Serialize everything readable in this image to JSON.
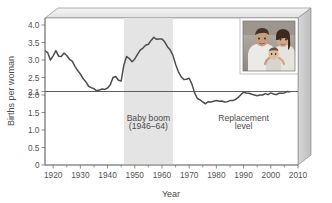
{
  "chart_data": {
    "type": "line",
    "title": "",
    "xlabel": "Year",
    "ylabel": "Births per woman",
    "xlim": [
      1917,
      2010
    ],
    "ylim": [
      0,
      4.2
    ],
    "grid": false,
    "legend_position": "none",
    "x_ticks": [
      1920,
      1930,
      1940,
      1950,
      1960,
      1970,
      1980,
      1990,
      2000,
      2010
    ],
    "x_tick_labels": [
      "1920",
      "1930",
      "1940",
      "1950",
      "1960",
      "1970",
      "1980",
      "1990",
      "2000",
      "2010"
    ],
    "x_minor_ticks": [
      1925,
      1935,
      1945,
      1955,
      1965,
      1975,
      1985,
      1995,
      2005
    ],
    "y_ticks": [
      0,
      0.5,
      1.0,
      1.5,
      2.0,
      2.1,
      2.5,
      3.0,
      3.5,
      4.0
    ],
    "y_tick_labels": [
      "0",
      "0.5",
      "1.0",
      "1.5",
      "2.0",
      "2.1",
      "2.5",
      "3.0",
      "3.5",
      "4.0"
    ],
    "series": [
      {
        "name": "Total fertility rate",
        "color": "#4d4d4d",
        "x": [
          1917,
          1918,
          1919,
          1920,
          1921,
          1922,
          1923,
          1924,
          1925,
          1926,
          1927,
          1928,
          1929,
          1930,
          1931,
          1932,
          1933,
          1934,
          1935,
          1936,
          1937,
          1938,
          1939,
          1940,
          1941,
          1942,
          1943,
          1944,
          1945,
          1946,
          1947,
          1948,
          1949,
          1950,
          1951,
          1952,
          1953,
          1954,
          1955,
          1956,
          1957,
          1958,
          1959,
          1960,
          1961,
          1962,
          1963,
          1964,
          1965,
          1966,
          1967,
          1968,
          1969,
          1970,
          1971,
          1972,
          1973,
          1974,
          1975,
          1976,
          1977,
          1978,
          1979,
          1980,
          1981,
          1982,
          1983,
          1984,
          1985,
          1986,
          1987,
          1988,
          1989,
          1990,
          1991,
          1992,
          1993,
          1994,
          1995,
          1996,
          1997,
          1998,
          1999,
          2000,
          2001,
          2002,
          2003,
          2004,
          2005,
          2006,
          2007
        ],
        "y": [
          3.26,
          3.21,
          3.0,
          3.12,
          3.27,
          3.11,
          3.1,
          3.2,
          3.13,
          3.02,
          2.97,
          2.82,
          2.7,
          2.6,
          2.47,
          2.38,
          2.25,
          2.21,
          2.18,
          2.12,
          2.14,
          2.17,
          2.16,
          2.2,
          2.29,
          2.5,
          2.53,
          2.42,
          2.4,
          2.86,
          3.1,
          3.04,
          2.95,
          3.03,
          3.16,
          3.28,
          3.34,
          3.42,
          3.45,
          3.56,
          3.65,
          3.59,
          3.6,
          3.6,
          3.52,
          3.38,
          3.29,
          3.14,
          2.88,
          2.67,
          2.53,
          2.44,
          2.45,
          2.48,
          2.31,
          2.06,
          1.9,
          1.86,
          1.8,
          1.75,
          1.81,
          1.8,
          1.82,
          1.84,
          1.82,
          1.83,
          1.8,
          1.81,
          1.84,
          1.84,
          1.87,
          1.93,
          2.01,
          2.08,
          2.06,
          2.05,
          2.02,
          2.0,
          1.98,
          2.0,
          2.0,
          2.04,
          2.01,
          2.06,
          2.03,
          2.01,
          2.05,
          2.05,
          2.06,
          2.1,
          2.09
        ]
      }
    ],
    "reference_lines": [
      {
        "name": "replacement-level",
        "orientation": "horizontal",
        "value": 2.1,
        "label": "Replacement level",
        "color": "#4d4d4d"
      }
    ],
    "shaded_regions": [
      {
        "name": "baby-boom-band",
        "x_start": 1946,
        "x_end": 1964,
        "label": "Baby boom",
        "sublabel": "(1946–64)",
        "color": "#e4e4e4"
      }
    ],
    "annotations": [
      {
        "name": "baby-boom-label-line1",
        "text": "Baby boom",
        "x": 1955,
        "y": 1.25
      },
      {
        "name": "baby-boom-label-line2",
        "text": "(1946–64)",
        "x": 1955,
        "y": 1.02
      },
      {
        "name": "replacement-label-line1",
        "text": "Replacement",
        "x": 1990,
        "y": 1.25
      },
      {
        "name": "replacement-label-line2",
        "text": "level",
        "x": 1990,
        "y": 1.02
      }
    ],
    "inset_image": {
      "name": "family-photo",
      "description": "Photograph of a family: a man, a woman and a baby",
      "x_start": 1986,
      "x_end": 2006,
      "y_start": 2.35,
      "y_end": 3.95
    },
    "frame": {
      "style": "3d-box",
      "side_panel_color": "#cfcfcf",
      "edge_color": "#8c8c8c"
    }
  }
}
